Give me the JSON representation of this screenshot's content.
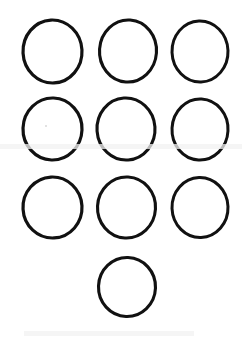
{
  "figure": {
    "background_color": "#ffffff",
    "stroke_color": "#111111",
    "width": 242,
    "height": 343,
    "shape_count": 10,
    "shape_kind": "circle-outline",
    "row_labels": [
      "row-1",
      "row-2",
      "row-3",
      "row-4"
    ],
    "rows": [
      {
        "label": "row-1",
        "count": 3,
        "circles": [
          {
            "name": "circle-r1-c1",
            "cx": 52.5,
            "cy": 51.5,
            "rx": 29.5,
            "ry": 31.5,
            "rotate": -3,
            "stroke": 3.2
          },
          {
            "name": "circle-r1-c2",
            "cx": 128.0,
            "cy": 51.0,
            "rx": 28.5,
            "ry": 31.0,
            "rotate": 4,
            "stroke": 3.1
          },
          {
            "name": "circle-r1-c3",
            "cx": 200.0,
            "cy": 51.5,
            "rx": 28.0,
            "ry": 30.5,
            "rotate": -2,
            "stroke": 3.0
          }
        ]
      },
      {
        "label": "row-2",
        "count": 3,
        "circles": [
          {
            "name": "circle-r2-c1",
            "cx": 52.5,
            "cy": 129.0,
            "rx": 29.5,
            "ry": 31.0,
            "rotate": 2,
            "stroke": 3.2
          },
          {
            "name": "circle-r2-c2",
            "cx": 126.0,
            "cy": 129.0,
            "rx": 29.0,
            "ry": 31.0,
            "rotate": -4,
            "stroke": 3.1
          },
          {
            "name": "circle-r2-c3",
            "cx": 200.0,
            "cy": 129.5,
            "rx": 28.0,
            "ry": 30.5,
            "rotate": 3,
            "stroke": 3.0
          }
        ]
      },
      {
        "label": "row-3",
        "count": 3,
        "circles": [
          {
            "name": "circle-r3-c1",
            "cx": 52.5,
            "cy": 207.5,
            "rx": 29.5,
            "ry": 30.5,
            "rotate": -3,
            "stroke": 3.2
          },
          {
            "name": "circle-r3-c2",
            "cx": 126.5,
            "cy": 207.5,
            "rx": 29.0,
            "ry": 30.5,
            "rotate": 3,
            "stroke": 3.1
          },
          {
            "name": "circle-r3-c3",
            "cx": 200.0,
            "cy": 207.5,
            "rx": 28.0,
            "ry": 30.0,
            "rotate": -2,
            "stroke": 3.0
          }
        ]
      },
      {
        "label": "row-4",
        "count": 1,
        "circles": [
          {
            "name": "circle-r4-c1",
            "cx": 127.0,
            "cy": 287.0,
            "rx": 28.5,
            "ry": 29.5,
            "rotate": 2,
            "stroke": 3.1
          }
        ]
      }
    ],
    "artifacts": [
      {
        "name": "scan-smudge-band",
        "x": 0,
        "y": 144,
        "w": 242,
        "h": 5
      },
      {
        "name": "scan-smudge-lower",
        "x": 24,
        "y": 331,
        "w": 170,
        "h": 5
      },
      {
        "name": "scan-speck",
        "x": 45,
        "y": 125,
        "w": 2,
        "h": 2
      }
    ]
  }
}
